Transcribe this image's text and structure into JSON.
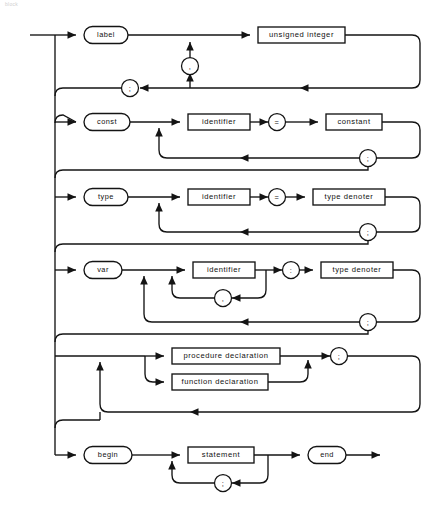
{
  "diagram": {
    "caption": "block",
    "type": "railroad-syntax-diagram",
    "title": "block",
    "ink_color": "#141414",
    "paper_color": "#ffffff",
    "rows": [
      {
        "id": "label-part",
        "keyword": "label",
        "items": [
          "unsigned integer"
        ],
        "repeat_separator": ",",
        "terminator": ";"
      },
      {
        "id": "const-part",
        "keyword": "const",
        "items": [
          "identifier",
          "=",
          "constant"
        ],
        "terminator": ";"
      },
      {
        "id": "type-part",
        "keyword": "type",
        "items": [
          "identifier",
          "=",
          "type denoter"
        ],
        "terminator": ";"
      },
      {
        "id": "var-part",
        "keyword": "var",
        "items": [
          "identifier",
          ":",
          "type denoter"
        ],
        "repeat_separator": ",",
        "terminator": ";"
      },
      {
        "id": "proc-func-part",
        "keyword": "",
        "items": [
          "procedure declaration",
          "function declaration"
        ],
        "terminator": ";"
      },
      {
        "id": "statement-part",
        "keyword": "begin",
        "items": [
          "statement"
        ],
        "repeat_separator": ";",
        "closer": "end"
      }
    ],
    "labels": {
      "label": "label",
      "unsigned_integer": "unsigned integer",
      "const": "const",
      "identifier": "identifier",
      "equals": "=",
      "constant": "constant",
      "type": "type",
      "type_denoter": "type denoter",
      "var": "var",
      "colon": ":",
      "procedure_declaration": "procedure declaration",
      "function_declaration": "function declaration",
      "begin": "begin",
      "statement": "statement",
      "end": "end",
      "comma": ",",
      "semicolon": ";"
    }
  }
}
